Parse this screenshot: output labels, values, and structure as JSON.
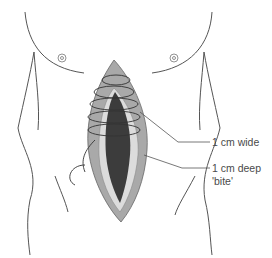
{
  "diagram": {
    "labels": [
      {
        "id": "wide",
        "text": "1 cm wide"
      },
      {
        "id": "deep_line1",
        "text": "1 cm deep"
      },
      {
        "id": "deep_line2",
        "text": "'bite'"
      }
    ],
    "colors": {
      "outline": "#555555",
      "wound_outer": "#a9a9a9",
      "wound_edge": "#d8d8d8",
      "wound_inner": "#3c3c3c",
      "suture": "#333333",
      "leader": "#555555"
    }
  }
}
